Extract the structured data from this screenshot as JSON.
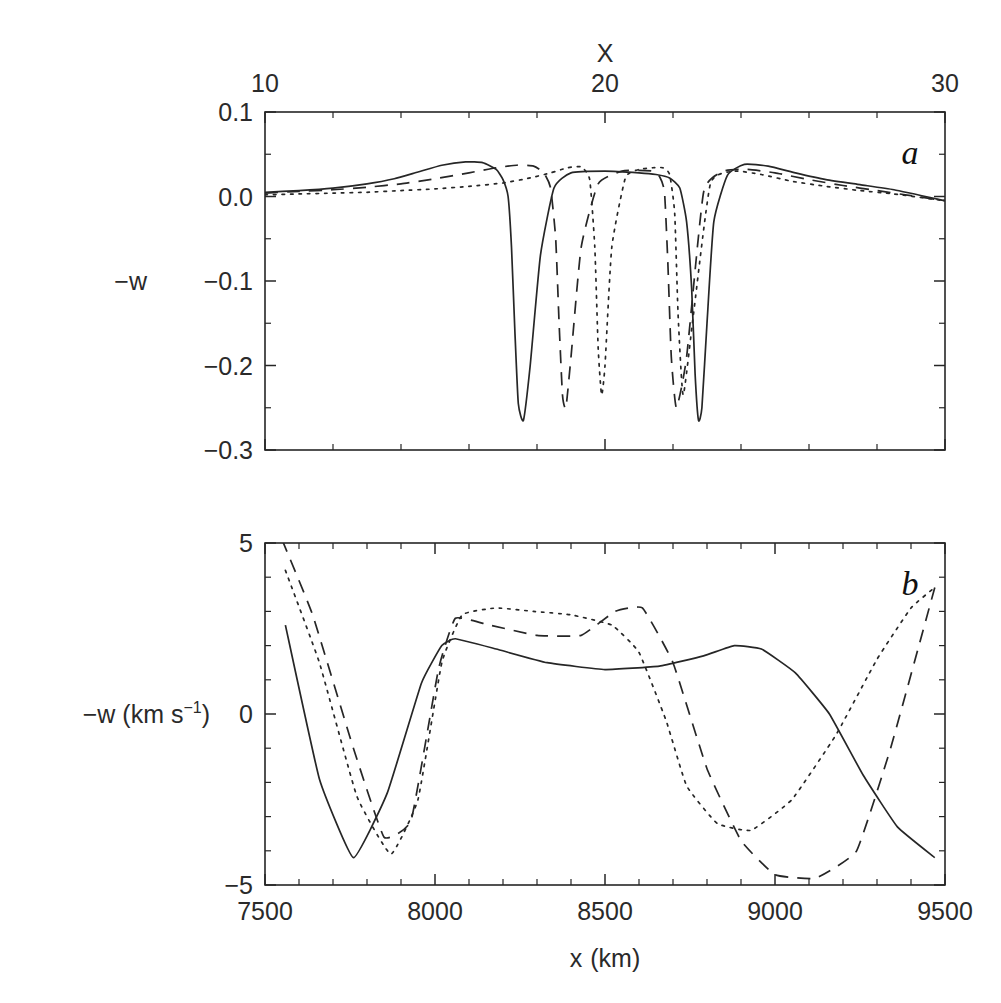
{
  "figure": {
    "panel_a_label": "a",
    "panel_b_label": "b"
  },
  "panel_a": {
    "top_axis_title": "X",
    "top_ticks": [
      "10",
      "20",
      "30"
    ],
    "y_axis_label": "−w",
    "y_ticks": [
      "0.1",
      "0.0",
      "−0.1",
      "−0.2",
      "−0.3"
    ]
  },
  "panel_b": {
    "y_axis_label_main": "−w  (km s",
    "y_axis_label_sup": "−1",
    "y_axis_label_tail": ")",
    "y_ticks": [
      "5",
      "0",
      "−5"
    ],
    "x_axis_title_main": "x",
    "x_axis_title_unit": "(km)",
    "x_ticks": [
      "7500",
      "8000",
      "8500",
      "9000",
      "9500"
    ]
  },
  "chart_data": [
    {
      "type": "line",
      "panel": "a",
      "title": "",
      "xlabel": "X",
      "ylabel": "-w",
      "xlim": [
        10,
        30
      ],
      "ylim": [
        -0.3,
        0.1
      ],
      "grid": false,
      "legend": "none",
      "axis_top": true,
      "xticks": [
        10,
        20,
        30
      ],
      "yticks": [
        0.1,
        0.0,
        -0.1,
        -0.2,
        -0.3
      ],
      "series": [
        {
          "name": "solid",
          "style": "solid",
          "x": [
            10.0,
            11.0,
            12.0,
            13.0,
            13.8,
            14.5,
            15.2,
            15.9,
            16.4,
            16.8,
            17.0,
            17.15,
            17.25,
            17.35,
            17.45,
            17.6,
            17.8,
            18.1,
            18.5,
            19.0,
            20.0,
            21.0,
            21.5,
            21.9,
            22.2,
            22.4,
            22.55,
            22.65,
            22.75,
            22.85,
            23.0,
            23.2,
            23.6,
            24.1,
            24.8,
            25.6,
            26.5,
            27.5,
            28.5,
            30.0
          ],
          "y": [
            0.005,
            0.007,
            0.01,
            0.015,
            0.021,
            0.029,
            0.037,
            0.041,
            0.04,
            0.032,
            0.02,
            0.0,
            -0.06,
            -0.16,
            -0.245,
            -0.265,
            -0.2,
            -0.07,
            0.01,
            0.028,
            0.03,
            0.028,
            0.026,
            0.022,
            0.01,
            -0.03,
            -0.11,
            -0.21,
            -0.265,
            -0.25,
            -0.15,
            -0.03,
            0.025,
            0.038,
            0.036,
            0.028,
            0.02,
            0.014,
            0.008,
            -0.005
          ]
        },
        {
          "name": "dashed",
          "style": "dashed",
          "x": [
            10.0,
            11.0,
            12.0,
            13.0,
            14.0,
            15.0,
            16.0,
            16.8,
            17.4,
            17.9,
            18.2,
            18.4,
            18.55,
            18.65,
            18.75,
            18.85,
            19.0,
            19.3,
            19.8,
            20.5,
            21.0,
            21.4,
            21.6,
            21.75,
            21.85,
            21.95,
            22.1,
            22.4,
            22.9,
            23.5,
            24.2,
            25.0,
            26.0,
            27.0,
            28.0,
            29.0,
            30.0
          ],
          "y": [
            0.004,
            0.006,
            0.008,
            0.011,
            0.015,
            0.021,
            0.028,
            0.034,
            0.037,
            0.036,
            0.028,
            0.01,
            -0.05,
            -0.15,
            -0.235,
            -0.25,
            -0.19,
            -0.06,
            0.015,
            0.03,
            0.031,
            0.03,
            0.024,
            0.005,
            -0.08,
            -0.19,
            -0.25,
            -0.19,
            0.005,
            0.03,
            0.032,
            0.028,
            0.02,
            0.013,
            0.007,
            0.001,
            -0.005
          ]
        },
        {
          "name": "dotted",
          "style": "dotted",
          "x": [
            10.0,
            11.0,
            12.0,
            13.0,
            14.0,
            15.0,
            16.0,
            17.0,
            17.8,
            18.4,
            18.9,
            19.3,
            19.55,
            19.7,
            19.8,
            19.9,
            20.0,
            20.2,
            20.6,
            21.0,
            21.4,
            21.7,
            21.9,
            22.05,
            22.15,
            22.3,
            22.6,
            23.1,
            23.8,
            24.6,
            25.5,
            26.5,
            27.5,
            28.5,
            30.0
          ],
          "y": [
            0.002,
            0.003,
            0.004,
            0.005,
            0.007,
            0.009,
            0.012,
            0.016,
            0.022,
            0.028,
            0.034,
            0.035,
            0.02,
            -0.06,
            -0.18,
            -0.235,
            -0.2,
            -0.06,
            0.022,
            0.032,
            0.034,
            0.034,
            0.026,
            -0.02,
            -0.14,
            -0.235,
            -0.14,
            0.015,
            0.03,
            0.026,
            0.018,
            0.012,
            0.007,
            0.003,
            -0.005
          ]
        }
      ]
    },
    {
      "type": "line",
      "panel": "b",
      "title": "",
      "xlabel": "x (km)",
      "ylabel": "-w (km s^-1)",
      "xlim": [
        7500,
        9500
      ],
      "ylim": [
        -5,
        5
      ],
      "grid": false,
      "legend": "none",
      "xticks": [
        7500,
        8000,
        8500,
        9000,
        9500
      ],
      "yticks": [
        5,
        0,
        -5
      ],
      "series": [
        {
          "name": "solid",
          "style": "solid",
          "x": [
            7560,
            7660,
            7760,
            7860,
            7960,
            8020,
            8060,
            8180,
            8330,
            8500,
            8660,
            8790,
            8880,
            8960,
            9060,
            9160,
            9260,
            9360,
            9470
          ],
          "y": [
            2.6,
            -1.9,
            -4.2,
            -2.3,
            0.9,
            2.0,
            2.2,
            1.9,
            1.5,
            1.3,
            1.4,
            1.7,
            2.0,
            1.9,
            1.2,
            0.0,
            -1.8,
            -3.3,
            -4.2
          ]
        },
        {
          "name": "dashed",
          "style": "dashed",
          "x": [
            7550,
            7640,
            7760,
            7850,
            7930,
            8010,
            8060,
            8160,
            8300,
            8430,
            8530,
            8610,
            8700,
            8800,
            8900,
            9000,
            9120,
            9240,
            9340,
            9470
          ],
          "y": [
            5.1,
            2.9,
            -1.0,
            -3.6,
            -3.1,
            1.3,
            2.8,
            2.6,
            2.3,
            2.3,
            3.0,
            3.1,
            1.5,
            -1.6,
            -3.7,
            -4.7,
            -4.8,
            -4.0,
            -1.0,
            3.7
          ]
        },
        {
          "name": "dotted",
          "style": "dotted",
          "x": [
            7560,
            7660,
            7770,
            7870,
            7950,
            8020,
            8080,
            8180,
            8290,
            8400,
            8520,
            8600,
            8680,
            8740,
            8830,
            8930,
            9050,
            9180,
            9300,
            9400,
            9470
          ],
          "y": [
            4.2,
            1.5,
            -2.4,
            -4.1,
            -2.5,
            1.5,
            2.9,
            3.1,
            3.0,
            2.9,
            2.6,
            1.8,
            -0.2,
            -2.1,
            -3.2,
            -3.4,
            -2.5,
            -0.6,
            1.6,
            3.1,
            3.7
          ]
        }
      ]
    }
  ]
}
